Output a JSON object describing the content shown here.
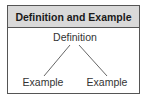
{
  "diagram": {
    "title": "Definition and Example",
    "root": {
      "label": "Definition"
    },
    "children": [
      {
        "label": "Example"
      },
      {
        "label": "Example"
      }
    ],
    "colors": {
      "header_fill": "#d9d9d9",
      "border": "#555555",
      "line": "#555555",
      "text": "#333333"
    }
  }
}
